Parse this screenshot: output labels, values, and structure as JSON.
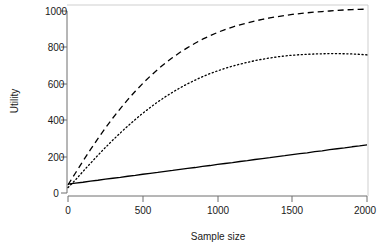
{
  "chart_data": {
    "type": "line",
    "title": "",
    "subtitle": "",
    "xlabel": "Sample size",
    "ylabel": "Utility",
    "xlim": [
      0,
      2000
    ],
    "ylim": [
      0,
      1050
    ],
    "xticks": [
      0,
      500,
      1000,
      1500,
      2000
    ],
    "yticks": [
      0,
      200,
      400,
      600,
      800,
      1000
    ],
    "xticklabels": [
      "0",
      "500",
      "1000",
      "1500",
      "2000"
    ],
    "yticklabels": [
      "0",
      "200",
      "400",
      "600",
      "800",
      "1000"
    ],
    "grid": false,
    "legend": false,
    "legend_position": "none",
    "box": "open-L-axes",
    "x": [
      0,
      50,
      100,
      150,
      200,
      250,
      300,
      350,
      400,
      450,
      500,
      550,
      600,
      650,
      700,
      750,
      800,
      850,
      900,
      950,
      1000,
      1050,
      1100,
      1150,
      1200,
      1250,
      1300,
      1350,
      1400,
      1450,
      1500,
      1550,
      1600,
      1650,
      1700,
      1750,
      1800,
      1850,
      1900,
      1950,
      2000
    ],
    "series": [
      {
        "name": "solid-line",
        "linestyle": "solid",
        "color": "#000000",
        "linewidth": 1.3,
        "values": [
          49,
          54,
          59,
          65,
          70,
          76,
          81,
          86,
          92,
          97,
          103,
          108,
          113,
          119,
          124,
          130,
          135,
          140,
          146,
          151,
          157,
          162,
          167,
          173,
          178,
          184,
          189,
          194,
          200,
          205,
          211,
          216,
          221,
          227,
          232,
          238,
          243,
          248,
          254,
          259,
          265
        ]
      },
      {
        "name": "dashed-line",
        "linestyle": "dashed",
        "color": "#000000",
        "linewidth": 1.3,
        "values": [
          45,
          110,
          175,
          238,
          299,
          357,
          412,
          464,
          513,
          559,
          602,
          642,
          679,
          713,
          744,
          773,
          799,
          823,
          845,
          864,
          882,
          898,
          912,
          924,
          935,
          945,
          954,
          962,
          969,
          975,
          981,
          986,
          990,
          994,
          997,
          1000,
          1003,
          1006,
          1008,
          1009,
          1010
        ]
      },
      {
        "name": "dotted-line",
        "linestyle": "dotted",
        "color": "#000000",
        "linewidth": 1.3,
        "values": [
          30,
          72,
          118,
          163,
          207,
          250,
          291,
          330,
          368,
          404,
          438,
          470,
          500,
          528,
          554,
          578,
          600,
          620,
          639,
          656,
          671,
          685,
          697,
          708,
          718,
          727,
          735,
          742,
          748,
          753,
          757,
          760,
          762,
          764,
          765,
          766,
          766,
          765,
          764,
          762,
          759
        ]
      }
    ],
    "annotations": []
  },
  "axes": {
    "y_title": "Utility",
    "x_title": "Sample size"
  }
}
